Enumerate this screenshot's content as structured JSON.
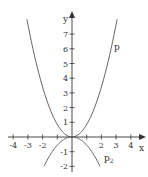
{
  "chart_data": {
    "type": "line",
    "title": "",
    "xlabel": "x",
    "ylabel": "y",
    "xlim": [
      -4.3,
      4.9
    ],
    "ylim": [
      -2.2,
      8.5
    ],
    "grid": false,
    "x_ticks": [
      -4,
      -3,
      -2,
      -1,
      1,
      2,
      3,
      4
    ],
    "x_tick_labels": [
      "-4",
      "-3",
      "-2",
      "",
      "",
      "2",
      "3",
      "4"
    ],
    "y_ticks": [
      -2,
      -1,
      1,
      2,
      3,
      4,
      5,
      6,
      7
    ],
    "y_tick_labels": [
      "-2",
      "-1",
      "1",
      "2",
      "3",
      "4",
      "5",
      "6",
      "7"
    ],
    "series": [
      {
        "name": "p",
        "label": "p",
        "formula": "approx 0.85*x^2",
        "x": [
          -3.07,
          -3,
          -2.5,
          -2,
          -1.5,
          -1,
          -0.5,
          0,
          0.5,
          1,
          1.5,
          2,
          2.5,
          3,
          3.07
        ],
        "values": [
          8.0,
          7.65,
          5.31,
          3.4,
          1.91,
          0.85,
          0.21,
          0,
          0.21,
          0.85,
          1.91,
          3.4,
          5.31,
          7.65,
          8.0
        ]
      },
      {
        "name": "p2",
        "label": "p",
        "label_subscript": "2",
        "formula": "approx -0.55*x^2",
        "x": [
          -1.9,
          -1.5,
          -1,
          -0.5,
          0,
          0.5,
          1,
          1.5,
          1.9
        ],
        "values": [
          -1.99,
          -1.24,
          -0.55,
          -0.14,
          0,
          -0.14,
          -0.55,
          -1.24,
          -1.99
        ]
      }
    ],
    "colors": {
      "axis": "#333333",
      "curve": "#555555",
      "text": "#333333"
    }
  }
}
